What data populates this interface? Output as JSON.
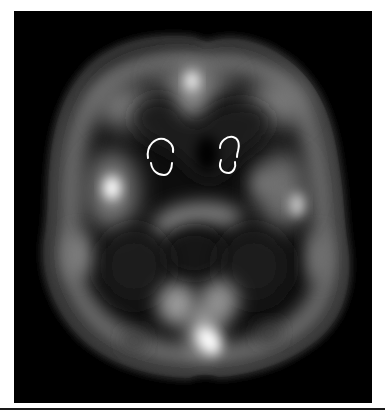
{
  "figure": {
    "modality_view": "axial",
    "colormap": "grayscale",
    "background_color": "#000000",
    "annotation_color": "#ffffff",
    "roi_markers": [
      {
        "name": "left-roi",
        "shape": "bracket-ellipse",
        "side": "left"
      },
      {
        "name": "right-roi",
        "shape": "bracket-ellipse",
        "side": "right"
      }
    ],
    "hot_spots": [
      {
        "name": "frontal-midline",
        "intensity": "high"
      },
      {
        "name": "left-temporal",
        "intensity": "high"
      },
      {
        "name": "right-temporal",
        "intensity": "medium"
      },
      {
        "name": "occipital-midline",
        "intensity": "very-high"
      }
    ]
  }
}
